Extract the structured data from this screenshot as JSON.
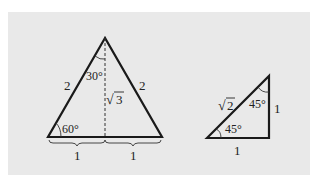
{
  "figure": {
    "equilateral_triangle": {
      "side_left_label": "2",
      "side_right_label": "2",
      "apex_angle_label": "30°",
      "base_angle_label": "60°",
      "height_label": "3",
      "height_label_prefix": "√",
      "base_half_left_label": "1",
      "base_half_right_label": "1"
    },
    "right_triangle": {
      "hypotenuse_label": "2",
      "hypotenuse_label_prefix": "√",
      "top_angle_label": "45°",
      "bottom_angle_label": "45°",
      "vertical_leg_label": "1",
      "horizontal_leg_label": "1"
    },
    "colors": {
      "background": "#e9e9e9",
      "stroke": "#1a1a1a"
    }
  }
}
